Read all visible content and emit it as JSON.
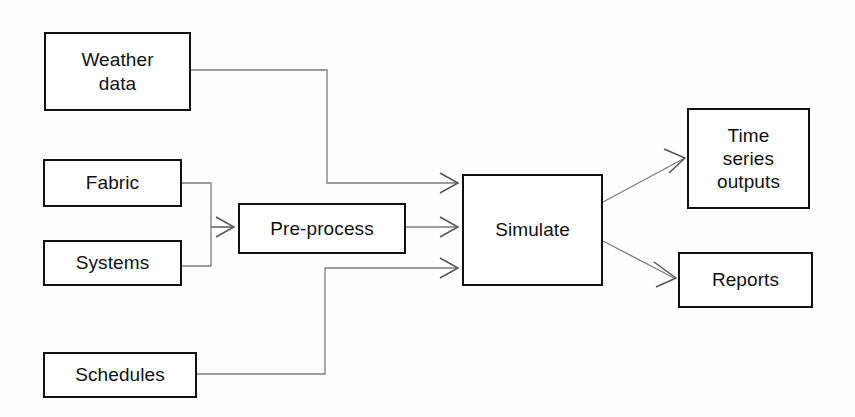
{
  "diagram": {
    "canvas": {
      "width": 855,
      "height": 417,
      "background": "#fefefe"
    },
    "style": {
      "node_border_color": "#111111",
      "node_fill_color": "#ffffff",
      "connector_color": "#777777",
      "arrowhead_color": "#555555",
      "text_color": "#111111"
    },
    "nodes": {
      "weather": {
        "label": "Weather\ndata",
        "kind": "input"
      },
      "fabric": {
        "label": "Fabric",
        "kind": "input"
      },
      "systems": {
        "label": "Systems",
        "kind": "input"
      },
      "schedules": {
        "label": "Schedules",
        "kind": "input"
      },
      "preprocess": {
        "label": "Pre-process",
        "kind": "process"
      },
      "simulate": {
        "label": "Simulate",
        "kind": "process"
      },
      "timeseries": {
        "label": "Time\nseries\noutputs",
        "kind": "output"
      },
      "reports": {
        "label": "Reports",
        "kind": "output"
      }
    },
    "edges": [
      {
        "id": "weather-to-simulate",
        "from": "weather",
        "to": "simulate",
        "routing": "orthogonal",
        "arrowhead": "open-v"
      },
      {
        "id": "fabric-to-preprocess",
        "from": "fabric",
        "to": "preprocess",
        "routing": "orthogonal",
        "arrowhead": "open-v"
      },
      {
        "id": "systems-to-preprocess",
        "from": "systems",
        "to": "preprocess",
        "routing": "orthogonal",
        "arrowhead": "open-v"
      },
      {
        "id": "preprocess-to-simulate",
        "from": "preprocess",
        "to": "simulate",
        "routing": "straight",
        "arrowhead": "open-v"
      },
      {
        "id": "schedules-to-simulate",
        "from": "schedules",
        "to": "simulate",
        "routing": "orthogonal",
        "arrowhead": "open-v"
      },
      {
        "id": "simulate-to-timeseries",
        "from": "simulate",
        "to": "timeseries",
        "routing": "diagonal",
        "arrowhead": "open-v"
      },
      {
        "id": "simulate-to-reports",
        "from": "simulate",
        "to": "reports",
        "routing": "diagonal",
        "arrowhead": "open-v"
      }
    ]
  }
}
